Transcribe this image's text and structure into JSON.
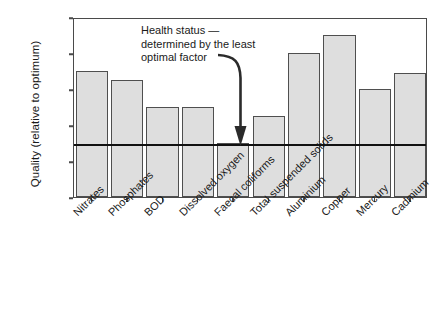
{
  "chart_data": {
    "type": "bar",
    "title": "",
    "subtitle": "",
    "xlabel": "",
    "ylabel": "Quality (relative to optimum)",
    "categories": [
      "Nitrates",
      "Phosphates",
      "BOD",
      "Dissolved oxygen",
      "Faecal coliforms",
      "Total suspended solids",
      "Aluminium",
      "Copper",
      "Mercury",
      "Cadmium"
    ],
    "values": [
      0.7,
      0.65,
      0.5,
      0.5,
      0.3,
      0.45,
      0.8,
      0.9,
      0.6,
      0.69
    ],
    "ylim": [
      0,
      1
    ],
    "yticks": [
      0,
      0.2,
      0.4,
      0.6,
      0.8,
      1
    ],
    "ytick_labels": [
      "0",
      "0.2",
      "0.4",
      "0.6",
      "0.8",
      "1"
    ],
    "grid": false,
    "legend": false,
    "legend_position": "none",
    "bar_fill_color": "#dedede",
    "bar_edge_color": "#4f4f4f",
    "axis_color": "#4a4a4a",
    "threshold": {
      "value": 0.3,
      "color": "#111111",
      "label": "Health status — determined by the least optimal factor"
    },
    "annotations": [
      {
        "name": "health-status-note",
        "lines": [
          "Health status —",
          "determined by the least",
          "optimal factor"
        ],
        "points_to_category": "Faecal coliforms",
        "points_to_value": 0.3
      }
    ]
  },
  "annotation": {
    "line1": "Health status —",
    "line2": "determined by the least",
    "line3": "optimal factor"
  },
  "axes": {
    "y_title": "Quality (relative to optimum)"
  }
}
